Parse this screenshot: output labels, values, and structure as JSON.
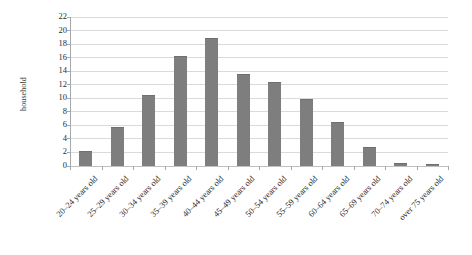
{
  "chart_data": {
    "type": "bar",
    "title": "",
    "xlabel": "",
    "ylabel": "household",
    "ylim": [
      0,
      22
    ],
    "ytick_step": 2,
    "grid": true,
    "legend": "none",
    "bar_color": "#7e7e7e",
    "gridline_color": "#d9dadb",
    "axis_color": "#a6a8ab",
    "categories": [
      "20–24 years old",
      "25–29 years old",
      "30–34 years old",
      "35–39 years old",
      "40–44 years old",
      "45–49 years old",
      "50–54 years old",
      "55–59 years old",
      "60–64 years old",
      "65–69 years old",
      "70–74 years old",
      "over 75 years old"
    ],
    "values": [
      2.0,
      5.6,
      10.4,
      16.1,
      18.8,
      13.5,
      12.3,
      9.8,
      6.3,
      2.6,
      0.3,
      0.1
    ],
    "ytick_labels": [
      "0",
      "2",
      "4",
      "6",
      "8",
      "10",
      "12",
      "14",
      "16",
      "18",
      "20",
      "22"
    ]
  }
}
